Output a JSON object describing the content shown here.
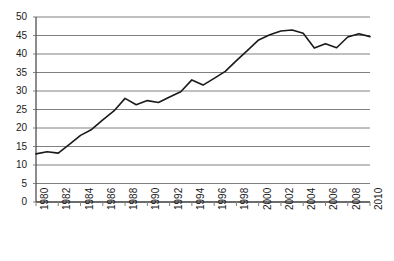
{
  "chart_data": {
    "type": "line",
    "title": "",
    "subtitle": "",
    "xlabel": "",
    "ylabel": "",
    "xlim": [
      1980,
      2010
    ],
    "ylim": [
      0,
      50
    ],
    "ytick_step": 5,
    "xtick_step": 2,
    "grid": "horizontal",
    "legend": "none",
    "yticks": [
      0,
      5,
      10,
      15,
      20,
      25,
      30,
      35,
      40,
      45,
      50
    ],
    "xticks": [
      1980,
      1982,
      1984,
      1986,
      1988,
      1990,
      1992,
      1994,
      1996,
      1998,
      2000,
      2002,
      2004,
      2006,
      2008,
      2010
    ],
    "xtick_labels": [
      "1980",
      "1982",
      "1984",
      "1986",
      "1988",
      "1990",
      "1992",
      "1994",
      "1996",
      "1998",
      "2000",
      "2002",
      "2004",
      "2006",
      "2008",
      "2010"
    ],
    "ytick_labels": [
      "0",
      "5",
      "10",
      "15",
      "20",
      "25",
      "30",
      "35",
      "40",
      "45",
      "50"
    ],
    "x": [
      1980,
      1981,
      1982,
      1983,
      1984,
      1985,
      1986,
      1987,
      1988,
      1989,
      1990,
      1991,
      1992,
      1993,
      1994,
      1995,
      1996,
      1997,
      1998,
      1999,
      2000,
      2001,
      2002,
      2003,
      2004,
      2005,
      2006,
      2007,
      2008,
      2009,
      2010
    ],
    "series": [
      {
        "name": "series-1",
        "color": "#1a1a1a",
        "values": [
          13.0,
          13.6,
          13.2,
          15.6,
          18.0,
          19.6,
          22.2,
          24.6,
          28.0,
          26.3,
          27.4,
          26.9,
          28.4,
          29.8,
          33.0,
          31.6,
          33.4,
          35.3,
          38.2,
          41.0,
          43.8,
          45.2,
          46.2,
          46.5,
          45.6,
          41.6,
          42.8,
          41.7,
          44.6,
          45.5,
          44.7
        ]
      }
    ]
  },
  "axes": {
    "line_color": "#1a1a1a",
    "grid_color": "#808080",
    "tick_color": "#808080",
    "label_color": "#1a1a1a"
  }
}
